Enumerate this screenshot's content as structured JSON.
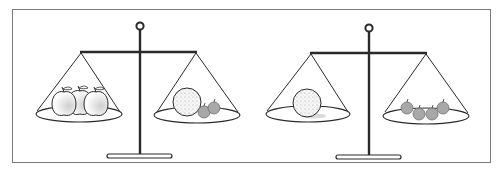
{
  "figure": {
    "colors": {
      "frame": "#7a7a7a",
      "stand": "#2a2a2a",
      "apple_fill": "#ffffff",
      "apple_shade": "#d4d4d4",
      "orange_fill": "#f4f4f4",
      "small_fruit_fill": "#a8a8a8"
    },
    "scales": [
      {
        "id": "left-scale",
        "state": "balanced",
        "left_pan": {
          "items": [
            {
              "type": "apple",
              "count": 3
            }
          ]
        },
        "right_pan": {
          "items": [
            {
              "type": "orange",
              "count": 1
            },
            {
              "type": "small-fruit",
              "count": 2
            }
          ]
        }
      },
      {
        "id": "right-scale",
        "state": "balanced",
        "left_pan": {
          "items": [
            {
              "type": "orange",
              "count": 1
            }
          ]
        },
        "right_pan": {
          "items": [
            {
              "type": "small-fruit",
              "count": 4
            }
          ]
        }
      }
    ]
  }
}
